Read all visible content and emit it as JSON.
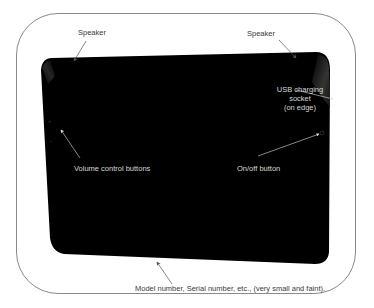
{
  "diagram": {
    "device": {
      "body_color": "#000000",
      "frame_border_color": "#8a8a8a",
      "background_color": "#ffffff"
    },
    "labels": {
      "speaker_left": "Speaker",
      "speaker_right": "Speaker",
      "usb_line1": "USB charging",
      "usb_line2": "socket",
      "usb_line3": "(on edge)",
      "volume": "Volume control buttons",
      "onoff": "On/off button",
      "model": "Model number, Serial number, etc., (very small and faint)."
    },
    "icons": {
      "volume_plus": "+",
      "volume_minus": "–",
      "power": "⏻"
    },
    "colors": {
      "label_on_white": "#3a3a3a",
      "label_on_black": "#d8d8d8",
      "arrow_on_white": "#555555",
      "arrow_on_black": "#e0e0e0"
    }
  }
}
